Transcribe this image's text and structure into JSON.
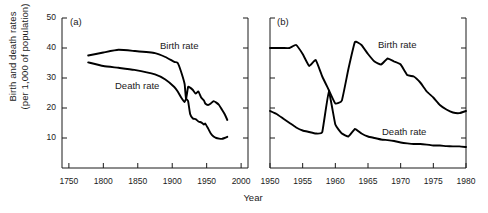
{
  "figure": {
    "axis_title_y": "Birth and death rates\n(per 1,000 of population)",
    "axis_title_x": "Year",
    "line_color": "#000000",
    "axis_color": "#1a1a1a",
    "background": "#ffffff"
  },
  "panels": [
    {
      "tag": "(a)",
      "xlabels": [
        "1750",
        "1800",
        "1850",
        "1900",
        "1950",
        "2000"
      ],
      "ylabels": [
        "10",
        "20",
        "30",
        "40",
        "50"
      ],
      "series_labels": {
        "birth": "Birth rate",
        "death": "Death rate"
      }
    },
    {
      "tag": "(b)",
      "xlabels": [
        "1950",
        "1955",
        "1960",
        "1965",
        "1970",
        "1975",
        "1980"
      ],
      "ylabels": [],
      "series_labels": {
        "birth": "Birth rate",
        "death": "Death rate"
      }
    }
  ],
  "chart_data": {
    "type": "line",
    "title": "",
    "xlabel": "Year",
    "ylabel": "Birth and death rates (per 1,000 of population)",
    "grid": false,
    "legend": "inline-annotations",
    "panels": [
      {
        "tag": "(a)",
        "xlim": [
          1740,
          2010
        ],
        "ylim": [
          0,
          50
        ],
        "xticks": [
          1750,
          1800,
          1850,
          1900,
          1950,
          2000
        ],
        "yticks": [
          10,
          20,
          30,
          40,
          50
        ],
        "series": [
          {
            "name": "Birth rate",
            "x": [
              1778,
              1800,
              1822,
              1845,
              1875,
              1890,
              1903,
              1908,
              1913,
              1918,
              1920,
              1923,
              1926,
              1930,
              1934,
              1938,
              1942,
              1946,
              1948,
              1952,
              1956,
              1960,
              1964,
              1968,
              1972,
              1976,
              1980
            ],
            "y": [
              37.5,
              38.5,
              39.4,
              39.0,
              38.3,
              37.0,
              35.4,
              35.0,
              32.0,
              28.0,
              23.0,
              27.0,
              26.8,
              26.0,
              24.8,
              25.5,
              23.5,
              22.5,
              21.5,
              21.0,
              21.5,
              22.3,
              21.8,
              21.0,
              19.5,
              18.0,
              16.0
            ]
          },
          {
            "name": "Death rate",
            "x": [
              1778,
              1800,
              1822,
              1845,
              1875,
              1890,
              1903,
              1908,
              1913,
              1918,
              1920,
              1923,
              1926,
              1930,
              1934,
              1938,
              1942,
              1946,
              1948,
              1952,
              1956,
              1960,
              1964,
              1968,
              1972,
              1976,
              1980
            ],
            "y": [
              35.2,
              34.0,
              33.4,
              32.7,
              31.2,
              29.5,
              27.0,
              25.5,
              23.5,
              22.0,
              23.0,
              22.3,
              18.0,
              16.5,
              16.3,
              15.5,
              15.2,
              14.5,
              14.8,
              13.2,
              11.5,
              10.5,
              10.0,
              9.8,
              9.7,
              10.0,
              10.4
            ]
          }
        ]
      },
      {
        "tag": "(b)",
        "xlim": [
          1950,
          1980
        ],
        "ylim": [
          0,
          50
        ],
        "xticks": [
          1950,
          1955,
          1960,
          1965,
          1970,
          1975,
          1980
        ],
        "yticks": [
          10,
          20,
          30,
          40,
          50
        ],
        "series": [
          {
            "name": "Birth rate",
            "x": [
              1950,
              1951,
              1952,
              1953,
              1954,
              1955,
              1956,
              1957,
              1958,
              1959,
              1960,
              1961,
              1962,
              1963,
              1964,
              1965,
              1966,
              1967,
              1968,
              1969,
              1970,
              1971,
              1972,
              1973,
              1974,
              1975,
              1976,
              1977,
              1978,
              1979,
              1980
            ],
            "y": [
              40.0,
              40.0,
              40.0,
              40.0,
              41.0,
              38.0,
              34.0,
              36.0,
              30.5,
              26.0,
              21.5,
              22.5,
              33.0,
              42.0,
              41.0,
              38.0,
              35.5,
              34.5,
              36.5,
              35.5,
              34.5,
              31.0,
              30.5,
              28.5,
              25.5,
              23.5,
              21.0,
              19.5,
              18.5,
              18.3,
              19.0
            ]
          },
          {
            "name": "Death rate",
            "x": [
              1950,
              1951,
              1952,
              1953,
              1954,
              1955,
              1956,
              1957,
              1958,
              1959,
              1960,
              1961,
              1962,
              1963,
              1964,
              1965,
              1966,
              1967,
              1968,
              1969,
              1970,
              1971,
              1972,
              1973,
              1974,
              1975,
              1976,
              1977,
              1978,
              1979,
              1980
            ],
            "y": [
              19.0,
              18.0,
              16.5,
              15.0,
              13.5,
              12.5,
              12.0,
              11.5,
              12.0,
              25.5,
              14.5,
              11.5,
              10.5,
              13.0,
              11.5,
              10.5,
              10.0,
              9.5,
              9.3,
              9.0,
              8.5,
              8.2,
              8.0,
              8.0,
              7.8,
              7.5,
              7.5,
              7.3,
              7.2,
              7.2,
              7.0
            ]
          }
        ]
      }
    ]
  }
}
